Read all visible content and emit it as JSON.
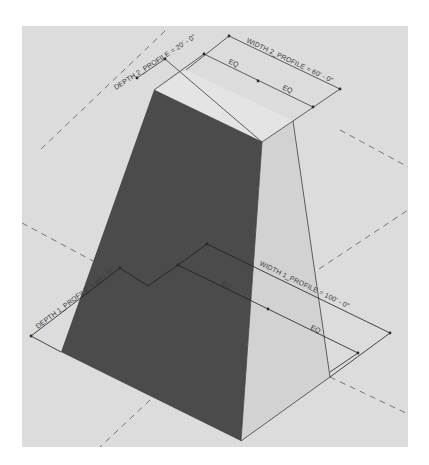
{
  "diagram": {
    "colors": {
      "page": "#ffffff",
      "canvas": "#dcdcdc",
      "dark_face": "#4b4b4b",
      "light_face": "#d2d2d2",
      "top_face": "#e4e4e4",
      "dim_line": "#3a3a3a",
      "dash_line": "#6a6a6a"
    },
    "labels": {
      "width2": "WIDTH 2_PROFILE = 60' - 0\"",
      "depth2": "DEPTH 2_PROFILE = 20' - 0\"",
      "width1": "WIDTH 1_PROFILE = 100' - 0\"",
      "depth1": "DEPTH 1_PROFILE = 40' - 0\"",
      "eq_top_left": "EQ",
      "eq_top_right": "EQ",
      "eq_bottom_left": "EQ",
      "eq_bottom_right": "EQ"
    },
    "shape": {
      "top_face": [
        [
          154,
          90
        ],
        [
          186,
          70
        ],
        [
          293,
          121
        ],
        [
          262,
          142
        ]
      ],
      "dark_face": [
        [
          154,
          90
        ],
        [
          262,
          142
        ],
        [
          241,
          441
        ],
        [
          61,
          352
        ]
      ],
      "light_face": [
        [
          262,
          142
        ],
        [
          293,
          121
        ],
        [
          330,
          377
        ],
        [
          241,
          441
        ]
      ]
    }
  }
}
